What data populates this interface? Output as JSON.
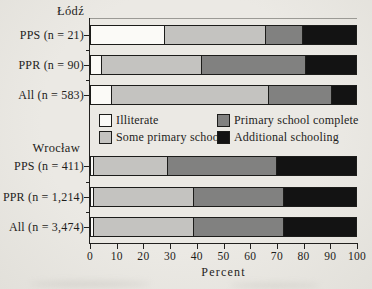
{
  "figure": {
    "background": "#e9e7e2",
    "ink_color": "#1e1d1b"
  },
  "chart_data": {
    "type": "bar",
    "orientation": "horizontal",
    "stacked": true,
    "xlabel": "Percent",
    "xlim": [
      0,
      100
    ],
    "x_ticks": [
      0,
      10,
      20,
      30,
      40,
      50,
      60,
      70,
      80,
      90,
      100
    ],
    "grid": false,
    "legend_position": "center-between-groups",
    "legend": [
      {
        "label": "Illiterate",
        "color": "#fbfaf7"
      },
      {
        "label": "Some primary school",
        "color": "#c4c3c0"
      },
      {
        "label": "Primary school complete",
        "color": "#818180"
      },
      {
        "label": "Additional schooling",
        "color": "#131313"
      }
    ],
    "groups": [
      {
        "name": "Łódź",
        "rows": [
          {
            "label": "PPS (n = 21)",
            "values": [
              28,
              38,
              14,
              20
            ]
          },
          {
            "label": "PPR (n = 90)",
            "values": [
              4,
              38,
              39,
              19
            ]
          },
          {
            "label": "All (n = 583)",
            "values": [
              8,
              59,
              24,
              9
            ]
          }
        ]
      },
      {
        "name": "Wrocław",
        "rows": [
          {
            "label": "PPS (n = 411)",
            "values": [
              1,
              28,
              41,
              30
            ]
          },
          {
            "label": "PPR (n = 1,214)",
            "values": [
              1,
              38,
              34,
              27
            ]
          },
          {
            "label": "All (n = 3,474)",
            "values": [
              1,
              38,
              34,
              27
            ]
          }
        ]
      }
    ]
  }
}
